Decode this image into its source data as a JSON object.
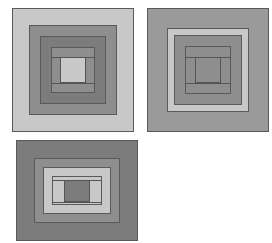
{
  "figure": {
    "background_color": "#ffffff",
    "width": 272,
    "height": 243
  },
  "palette": {
    "light": "#c8c8c8",
    "light_alt": "#cccccc",
    "medium": "#9a9a9a",
    "medium_dark": "#8e8e8e",
    "dark": "#7c7c7c",
    "darker": "#737373",
    "outline": "#5a5a5a",
    "hairline": "#555555",
    "white": "#ffffff"
  },
  "blocks": [
    {
      "id": "block-1",
      "label": "Block 1",
      "position": {
        "left": 12,
        "top": 8,
        "width": 122,
        "height": 124
      },
      "rings": [
        {
          "name": "outer-border",
          "color": "#c8c8c8",
          "inset": 0
        },
        {
          "name": "ring-2",
          "color": "#8e8e8e",
          "inset": 17
        },
        {
          "name": "ring-3",
          "color": "#7c7c7c",
          "inset": 28
        },
        {
          "name": "ring-4",
          "color": "#8e8e8e",
          "inset": 39
        }
      ],
      "center": {
        "name": "center-square",
        "color": "#c8c8c8",
        "left": 48,
        "top": 49,
        "width": 26,
        "height": 26
      }
    },
    {
      "id": "block-2",
      "label": "Block 2",
      "position": {
        "left": 147,
        "top": 8,
        "width": 122,
        "height": 124
      },
      "rings": [
        {
          "name": "outer-border",
          "color": "#9a9a9a",
          "inset": 0
        },
        {
          "name": "ring-2",
          "color": "#c8c8c8",
          "inset": 20
        },
        {
          "name": "ring-3",
          "color": "#8e8e8e",
          "inset": 27
        },
        {
          "name": "ring-4",
          "color": "#8e8e8e",
          "inset": 38
        }
      ],
      "center": {
        "name": "center-square",
        "color": "#8e8e8e",
        "left": 48,
        "top": 49,
        "width": 26,
        "height": 26
      }
    },
    {
      "id": "block-3",
      "label": "Block 3",
      "position": {
        "left": 16,
        "top": 140,
        "width": 122,
        "height": 101
      },
      "rings": [
        {
          "name": "outer-border",
          "color": "#7c7c7c",
          "inset": 0
        },
        {
          "name": "ring-2",
          "color": "#8e8e8e",
          "inset": 18
        },
        {
          "name": "ring-3",
          "color": "#c8c8c8",
          "inset": 27
        },
        {
          "name": "ring-4",
          "color": "#c8c8c8",
          "inset": 36
        }
      ],
      "center": {
        "name": "center-square",
        "color": "#7c7c7c",
        "left": 48,
        "top": 40,
        "width": 26,
        "height": 22
      }
    }
  ]
}
